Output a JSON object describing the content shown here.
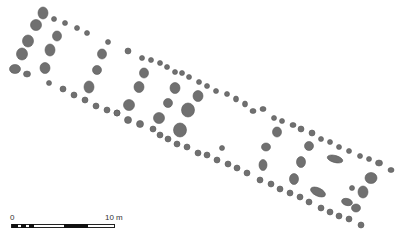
{
  "figure": {
    "type": "site-plan",
    "feature_fill": "#707070",
    "feature_stroke": "#5a5a5a",
    "background": "#ffffff"
  },
  "features": [
    {
      "x": 43,
      "y": 13,
      "rx": 5,
      "ry": 6
    },
    {
      "x": 36,
      "y": 25,
      "rx": 5.5,
      "ry": 5.5
    },
    {
      "x": 28,
      "y": 41,
      "rx": 5.5,
      "ry": 6
    },
    {
      "x": 22,
      "y": 54,
      "rx": 5.5,
      "ry": 6
    },
    {
      "x": 15,
      "y": 69,
      "rx": 5.5,
      "ry": 4.5
    },
    {
      "x": 27,
      "y": 74,
      "rx": 3.5,
      "ry": 3
    },
    {
      "x": 54,
      "y": 19,
      "rx": 2.5,
      "ry": 2.5
    },
    {
      "x": 65,
      "y": 23,
      "rx": 2.5,
      "ry": 2.5
    },
    {
      "x": 77,
      "y": 28,
      "rx": 2.5,
      "ry": 2.5
    },
    {
      "x": 87,
      "y": 33,
      "rx": 2.5,
      "ry": 2.5
    },
    {
      "x": 57,
      "y": 36,
      "rx": 4.5,
      "ry": 5
    },
    {
      "x": 50,
      "y": 50,
      "rx": 5,
      "ry": 6
    },
    {
      "x": 45,
      "y": 68,
      "rx": 5,
      "ry": 5.5
    },
    {
      "x": 49,
      "y": 83,
      "rx": 2.5,
      "ry": 2.5
    },
    {
      "x": 63,
      "y": 89,
      "rx": 3,
      "ry": 3
    },
    {
      "x": 74,
      "y": 95,
      "rx": 3,
      "ry": 3
    },
    {
      "x": 85,
      "y": 100,
      "rx": 3,
      "ry": 3
    },
    {
      "x": 96,
      "y": 106,
      "rx": 3,
      "ry": 3
    },
    {
      "x": 107,
      "y": 110,
      "rx": 3,
      "ry": 3
    },
    {
      "x": 117,
      "y": 113,
      "rx": 3,
      "ry": 3
    },
    {
      "x": 108,
      "y": 42,
      "rx": 2.5,
      "ry": 2.5
    },
    {
      "x": 102,
      "y": 54,
      "rx": 4.5,
      "ry": 5
    },
    {
      "x": 97,
      "y": 70,
      "rx": 4.5,
      "ry": 4.5
    },
    {
      "x": 89,
      "y": 87,
      "rx": 5,
      "ry": 6
    },
    {
      "x": 128,
      "y": 51,
      "rx": 3,
      "ry": 3
    },
    {
      "x": 142,
      "y": 58,
      "rx": 2.5,
      "ry": 2.5
    },
    {
      "x": 151,
      "y": 60,
      "rx": 2.5,
      "ry": 2.5
    },
    {
      "x": 160,
      "y": 63,
      "rx": 2.5,
      "ry": 2.5
    },
    {
      "x": 167,
      "y": 67,
      "rx": 2.5,
      "ry": 2.5
    },
    {
      "x": 175,
      "y": 72,
      "rx": 2.5,
      "ry": 2.5
    },
    {
      "x": 182,
      "y": 73,
      "rx": 2.5,
      "ry": 2.5
    },
    {
      "x": 189,
      "y": 77,
      "rx": 2.5,
      "ry": 2.5
    },
    {
      "x": 199,
      "y": 82,
      "rx": 2.5,
      "ry": 2.5
    },
    {
      "x": 207,
      "y": 86,
      "rx": 2.5,
      "ry": 2.5
    },
    {
      "x": 216,
      "y": 91,
      "rx": 2.5,
      "ry": 2.5
    },
    {
      "x": 227,
      "y": 94,
      "rx": 2.5,
      "ry": 2.5
    },
    {
      "x": 236,
      "y": 99,
      "rx": 2.5,
      "ry": 3
    },
    {
      "x": 245,
      "y": 104,
      "rx": 2.5,
      "ry": 3
    },
    {
      "x": 253,
      "y": 111,
      "rx": 3,
      "ry": 2.5
    },
    {
      "x": 263,
      "y": 109,
      "rx": 3,
      "ry": 2.5
    },
    {
      "x": 274,
      "y": 118,
      "rx": 2.5,
      "ry": 2.5
    },
    {
      "x": 282,
      "y": 121,
      "rx": 2.5,
      "ry": 2.5
    },
    {
      "x": 293,
      "y": 125,
      "rx": 3,
      "ry": 2.5
    },
    {
      "x": 301,
      "y": 129,
      "rx": 3,
      "ry": 3
    },
    {
      "x": 312,
      "y": 133,
      "rx": 3,
      "ry": 3
    },
    {
      "x": 321,
      "y": 139,
      "rx": 2.5,
      "ry": 2.5
    },
    {
      "x": 330,
      "y": 142,
      "rx": 2.5,
      "ry": 2.5
    },
    {
      "x": 339,
      "y": 147,
      "rx": 2.5,
      "ry": 2.5
    },
    {
      "x": 349,
      "y": 151,
      "rx": 2.5,
      "ry": 2.5
    },
    {
      "x": 360,
      "y": 156,
      "rx": 2.5,
      "ry": 2.5
    },
    {
      "x": 369,
      "y": 159,
      "rx": 2.5,
      "ry": 2.5
    },
    {
      "x": 379,
      "y": 163,
      "rx": 3.5,
      "ry": 3
    },
    {
      "x": 391,
      "y": 170,
      "rx": 3,
      "ry": 2.5
    },
    {
      "x": 144,
      "y": 73,
      "rx": 4.5,
      "ry": 5
    },
    {
      "x": 139,
      "y": 87,
      "rx": 5,
      "ry": 5.5
    },
    {
      "x": 129,
      "y": 105,
      "rx": 5.5,
      "ry": 5.5
    },
    {
      "x": 117,
      "y": 113,
      "rx": 3,
      "ry": 3
    },
    {
      "x": 128,
      "y": 120,
      "rx": 3.5,
      "ry": 3.5
    },
    {
      "x": 140,
      "y": 124,
      "rx": 3.5,
      "ry": 3.5
    },
    {
      "x": 153,
      "y": 129,
      "rx": 3,
      "ry": 3
    },
    {
      "x": 160,
      "y": 135,
      "rx": 3,
      "ry": 3
    },
    {
      "x": 168,
      "y": 139,
      "rx": 3,
      "ry": 3
    },
    {
      "x": 177,
      "y": 144,
      "rx": 3,
      "ry": 3
    },
    {
      "x": 187,
      "y": 147,
      "rx": 3,
      "ry": 3
    },
    {
      "x": 198,
      "y": 153,
      "rx": 3,
      "ry": 3
    },
    {
      "x": 207,
      "y": 155,
      "rx": 3,
      "ry": 3
    },
    {
      "x": 217,
      "y": 160,
      "rx": 3,
      "ry": 3
    },
    {
      "x": 228,
      "y": 164,
      "rx": 3,
      "ry": 3
    },
    {
      "x": 237,
      "y": 168,
      "rx": 3,
      "ry": 3
    },
    {
      "x": 247,
      "y": 173,
      "rx": 3,
      "ry": 3
    },
    {
      "x": 260,
      "y": 180,
      "rx": 3,
      "ry": 3
    },
    {
      "x": 271,
      "y": 184,
      "rx": 3,
      "ry": 3
    },
    {
      "x": 280,
      "y": 189,
      "rx": 3,
      "ry": 3
    },
    {
      "x": 290,
      "y": 193,
      "rx": 3,
      "ry": 3
    },
    {
      "x": 300,
      "y": 197,
      "rx": 3,
      "ry": 3
    },
    {
      "x": 309,
      "y": 202,
      "rx": 3,
      "ry": 3
    },
    {
      "x": 321,
      "y": 208,
      "rx": 3,
      "ry": 3
    },
    {
      "x": 330,
      "y": 212,
      "rx": 3,
      "ry": 3
    },
    {
      "x": 339,
      "y": 216,
      "rx": 3,
      "ry": 3
    },
    {
      "x": 349,
      "y": 219,
      "rx": 3,
      "ry": 3
    },
    {
      "x": 361,
      "y": 225,
      "rx": 3,
      "ry": 3
    },
    {
      "x": 175,
      "y": 88,
      "rx": 5,
      "ry": 5.5
    },
    {
      "x": 168,
      "y": 103,
      "rx": 4.5,
      "ry": 4.5
    },
    {
      "x": 159,
      "y": 118,
      "rx": 5.5,
      "ry": 5.5
    },
    {
      "x": 198,
      "y": 96,
      "rx": 5,
      "ry": 5.5
    },
    {
      "x": 188,
      "y": 110,
      "rx": 6.5,
      "ry": 7
    },
    {
      "x": 180,
      "y": 130,
      "rx": 6.5,
      "ry": 7
    },
    {
      "x": 222,
      "y": 148,
      "rx": 2.5,
      "ry": 2.5
    },
    {
      "x": 277,
      "y": 132,
      "rx": 4.5,
      "ry": 5
    },
    {
      "x": 266,
      "y": 147,
      "rx": 4.5,
      "ry": 4
    },
    {
      "x": 263,
      "y": 165,
      "rx": 4,
      "ry": 5.5
    },
    {
      "x": 309,
      "y": 146,
      "rx": 4.5,
      "ry": 4.5
    },
    {
      "x": 301,
      "y": 162,
      "rx": 4.5,
      "ry": 5.5
    },
    {
      "x": 294,
      "y": 179,
      "rx": 4.5,
      "ry": 5.5
    },
    {
      "x": 335,
      "y": 159,
      "rx": 8,
      "ry": 3.5,
      "rot": 15
    },
    {
      "x": 318,
      "y": 192,
      "rx": 8,
      "ry": 4,
      "rot": 25
    },
    {
      "x": 371,
      "y": 178,
      "rx": 6,
      "ry": 5.5
    },
    {
      "x": 363,
      "y": 192,
      "rx": 5,
      "ry": 6
    },
    {
      "x": 352,
      "y": 188,
      "rx": 2.5,
      "ry": 2.5
    },
    {
      "x": 347,
      "y": 202,
      "rx": 5.5,
      "ry": 3.5,
      "rot": 15
    },
    {
      "x": 356,
      "y": 208,
      "rx": 4.5,
      "ry": 4
    }
  ],
  "scale_bar": {
    "start_label": "0",
    "end_label": "10 m",
    "segments_black": [
      [
        0,
        6
      ],
      [
        9,
        14
      ],
      [
        17,
        22
      ],
      [
        52,
        76
      ]
    ]
  }
}
